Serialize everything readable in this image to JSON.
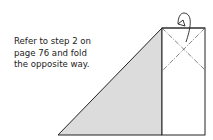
{
  "caption": {
    "lines": [
      "Refer to step 2 on",
      "page 76 and fold",
      "the opposite way."
    ]
  },
  "diagram": {
    "fill_color": "#dcdcdc",
    "line_color": "#222222"
  }
}
